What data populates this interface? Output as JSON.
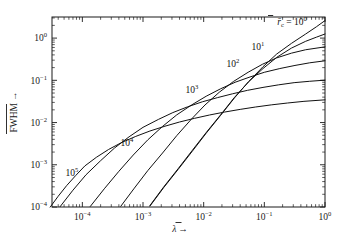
{
  "figure": {
    "background": "#ffffff",
    "ink": "#111111",
    "width": 349,
    "height": 240
  },
  "chart_data": {
    "type": "line",
    "title": "",
    "xlabel": "λ̄ →",
    "ylabel": "FWHM →",
    "xscale": "log",
    "yscale": "log",
    "xlim": [
      3.16e-05,
      1.0
    ],
    "ylim": [
      0.0001,
      3.16
    ],
    "grid": false,
    "legend_position": "inline-curve-labels",
    "legend_title": "r̄_c",
    "x_tick_labels": [
      "10⁻⁴",
      "10⁻³",
      "10⁻²",
      "10⁻¹",
      "10⁰"
    ],
    "x_tick_values": [
      0.0001,
      0.001,
      0.01,
      0.1,
      1.0
    ],
    "y_tick_labels": [
      "10⁻⁴",
      "10⁻³",
      "10⁻²",
      "10⁻¹",
      "10⁰"
    ],
    "y_tick_values": [
      0.0001,
      0.001,
      0.01,
      0.1,
      1.0
    ],
    "series": [
      {
        "name": "rc = 10^0",
        "label_base": "r̄",
        "label_sub": "c",
        "label_eq": " = 10",
        "label_exp": "0",
        "label_x": 292,
        "label_y": 25,
        "x": [
          0.0013,
          0.0022,
          0.0038,
          0.0065,
          0.011,
          0.019,
          0.032,
          0.055,
          0.095,
          0.16,
          0.28,
          0.48,
          0.72,
          1.0
        ],
        "y": [
          0.000105,
          0.00029,
          0.00078,
          0.0021,
          0.0056,
          0.0148,
          0.038,
          0.093,
          0.21,
          0.42,
          0.75,
          1.25,
          1.85,
          2.6
        ]
      },
      {
        "name": "rc = 10^1",
        "label_base": "10",
        "label_exp": "1",
        "label_x": 258,
        "label_y": 50,
        "x": [
          0.0013,
          0.0022,
          0.0038,
          0.0065,
          0.011,
          0.019,
          0.032,
          0.055,
          0.095,
          0.16,
          0.28,
          0.48,
          0.72,
          1.0
        ],
        "y": [
          0.000108,
          0.0003,
          0.00081,
          0.0022,
          0.0058,
          0.0152,
          0.039,
          0.092,
          0.19,
          0.35,
          0.58,
          0.84,
          1.05,
          1.25
        ]
      },
      {
        "name": "rc = 10^2",
        "label_base": "10",
        "label_exp": "2",
        "label_x": 233,
        "label_y": 67,
        "x": [
          0.00043,
          0.00072,
          0.0012,
          0.0021,
          0.0036,
          0.0062,
          0.0105,
          0.018,
          0.031,
          0.054,
          0.093,
          0.16,
          0.28,
          0.48,
          1.0
        ],
        "y": [
          0.000104,
          0.00028,
          0.00073,
          0.0019,
          0.0049,
          0.0118,
          0.026,
          0.052,
          0.094,
          0.155,
          0.24,
          0.34,
          0.44,
          0.53,
          0.62
        ]
      },
      {
        "name": "rc = 10^3",
        "label_base": "10",
        "label_exp": "3",
        "label_x": 192,
        "label_y": 93,
        "x": [
          0.000135,
          0.00023,
          0.0004,
          0.00069,
          0.0012,
          0.0021,
          0.0036,
          0.0063,
          0.011,
          0.019,
          0.033,
          0.058,
          0.1,
          0.18,
          0.32,
          0.56,
          1.0
        ],
        "y": [
          0.000103,
          0.00027,
          0.0007,
          0.0017,
          0.0039,
          0.0081,
          0.0152,
          0.026,
          0.042,
          0.063,
          0.09,
          0.12,
          0.155,
          0.19,
          0.225,
          0.26,
          0.29
        ]
      },
      {
        "name": "rc = 10^4",
        "label_base": "10",
        "label_exp": "4",
        "label_x": 127,
        "label_y": 146,
        "x": [
          4.3e-05,
          7e-05,
          0.000115,
          0.0002,
          0.00034,
          0.00059,
          0.001,
          0.0018,
          0.0031,
          0.0054,
          0.0095,
          0.017,
          0.03,
          0.053,
          0.095,
          0.17,
          0.31,
          0.56,
          1.0
        ],
        "y": [
          0.000102,
          0.00025,
          0.00058,
          0.00125,
          0.0025,
          0.0046,
          0.0077,
          0.0119,
          0.0172,
          0.0235,
          0.031,
          0.039,
          0.048,
          0.058,
          0.068,
          0.078,
          0.088,
          0.095,
          0.101
        ]
      },
      {
        "name": "rc = 10^5",
        "label_base": "10",
        "label_exp": "5",
        "label_x": 72,
        "label_y": 176,
        "x": [
          2.95e-05,
          4e-05,
          5.5e-05,
          7.8e-05,
          0.00011,
          0.00017,
          0.00027,
          0.00045,
          0.00076,
          0.0013,
          0.0023,
          0.004,
          0.0071,
          0.0125,
          0.022,
          0.04,
          0.071,
          0.13,
          0.24,
          0.45,
          1.0
        ],
        "y": [
          9.95e-05,
          0.00018,
          0.00032,
          0.00056,
          0.00094,
          0.0015,
          0.0023,
          0.0034,
          0.0047,
          0.0063,
          0.0082,
          0.0103,
          0.0126,
          0.0151,
          0.0177,
          0.0205,
          0.0233,
          0.0262,
          0.029,
          0.0318,
          0.0345
        ]
      }
    ]
  },
  "axes": {
    "x_title_symbol": "λ",
    "x_title_arrow": "→",
    "y_title_text": "FWHM",
    "y_title_arrow": "→"
  }
}
